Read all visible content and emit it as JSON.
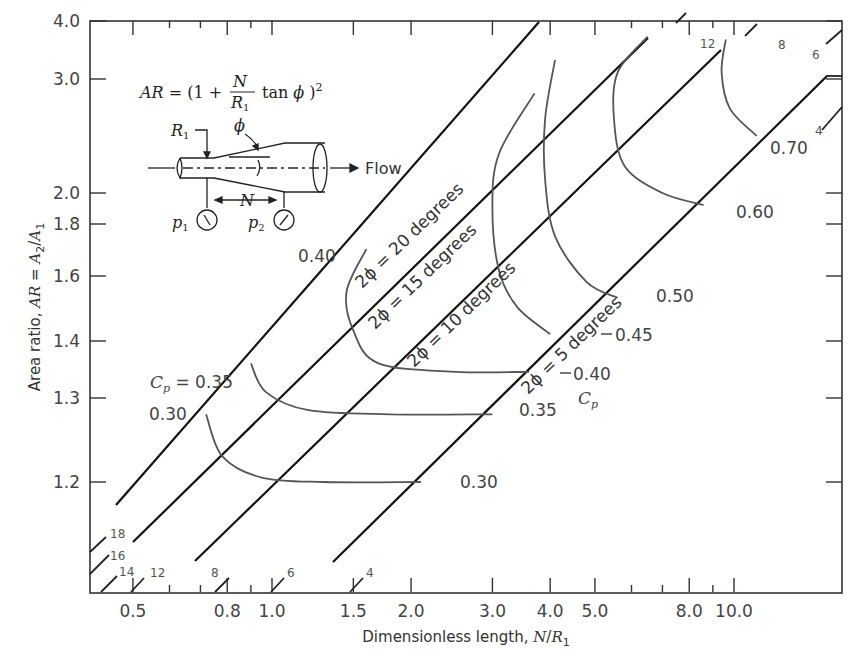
{
  "chart_data": {
    "type": "line",
    "title": "",
    "xlabel": "Dimensionless length, N/R1",
    "ylabel": "Area ratio, AR = A2/A1",
    "xscale": "log",
    "yscale": "log",
    "xlim": [
      0.4,
      18
    ],
    "ylim": [
      1.1,
      4.0
    ],
    "x_ticks": [
      0.5,
      0.8,
      1.0,
      1.5,
      2.0,
      3.0,
      4.0,
      5.0,
      8.0,
      10.0
    ],
    "x_tick_labels": [
      "0.5",
      "0.8",
      "1.0",
      "1.5",
      "2.0",
      "3.0",
      "4.0",
      "5.0",
      "8.0",
      "10.0"
    ],
    "y_ticks": [
      1.2,
      1.3,
      1.4,
      1.6,
      1.8,
      2.0,
      3.0,
      4.0
    ],
    "y_tick_labels": [
      "1.2",
      "1.3",
      "1.4",
      "1.6",
      "1.8",
      "2.0",
      "3.0",
      "4.0"
    ],
    "grid": false,
    "formula": "AR = (1 + N/R1 tan φ)^2",
    "diagram_labels": {
      "r1": "R1",
      "phi": "φ",
      "n": "N",
      "p1": "p1",
      "p2": "p2",
      "flow": "Flow"
    },
    "angle_lines": [
      {
        "name": "2φ = 20 degrees",
        "label": "2ϕ = 20 degrees"
      },
      {
        "name": "2φ = 15 degrees",
        "label": "2ϕ = 15 degrees"
      },
      {
        "name": "2φ = 10 degrees",
        "label": "2ϕ = 10 degrees"
      },
      {
        "name": "2φ = 5 degrees",
        "label": "2ϕ = 5 degrees"
      }
    ],
    "series": [
      {
        "name": "Cp = 0.30",
        "label": "0.30",
        "points": [
          [
            0.72,
            1.28
          ],
          [
            0.78,
            1.23
          ],
          [
            0.95,
            1.205
          ],
          [
            1.3,
            1.2
          ],
          [
            2.1,
            1.2
          ]
        ]
      },
      {
        "name": "Cp = 0.35",
        "label": "0.35",
        "points": [
          [
            0.9,
            1.36
          ],
          [
            0.97,
            1.31
          ],
          [
            1.2,
            1.285
          ],
          [
            1.8,
            1.28
          ],
          [
            3.0,
            1.28
          ]
        ]
      },
      {
        "name": "Cp = 0.40",
        "label": "0.40",
        "points": [
          [
            1.6,
            1.7
          ],
          [
            1.45,
            1.55
          ],
          [
            1.5,
            1.43
          ],
          [
            1.7,
            1.36
          ],
          [
            2.5,
            1.345
          ],
          [
            3.6,
            1.345
          ]
        ]
      },
      {
        "name": "Cp = 0.45",
        "label": "0.45",
        "points": [
          [
            3.7,
            2.85
          ],
          [
            3.1,
            2.3
          ],
          [
            3.0,
            1.9
          ],
          [
            3.1,
            1.62
          ],
          [
            3.4,
            1.5
          ],
          [
            4.0,
            1.42
          ]
        ]
      },
      {
        "name": "Cp = 0.50",
        "label": "0.50",
        "points": [
          [
            4.1,
            3.3
          ],
          [
            3.9,
            2.6
          ],
          [
            3.9,
            2.1
          ],
          [
            4.1,
            1.75
          ],
          [
            4.8,
            1.58
          ],
          [
            5.6,
            1.53
          ]
        ]
      },
      {
        "name": "Cp = 0.60",
        "label": "0.60",
        "points": [
          [
            6.5,
            3.7
          ],
          [
            5.6,
            3.1
          ],
          [
            5.5,
            2.6
          ],
          [
            5.8,
            2.2
          ],
          [
            7.0,
            2.0
          ],
          [
            8.6,
            1.92
          ]
        ]
      },
      {
        "name": "Cp = 0.70",
        "label": "0.70",
        "points": [
          [
            9.6,
            3.65
          ],
          [
            9.4,
            3.1
          ],
          [
            9.8,
            2.7
          ],
          [
            11.2,
            2.45
          ]
        ]
      }
    ],
    "cp_axis_label": "Cp",
    "cp_035_prefix": "Cp = 0.35",
    "edge_numbers_bottom": [
      "18",
      "16",
      "14",
      "12",
      "8",
      "6",
      "4"
    ],
    "edge_numbers_top": [
      "12",
      "8",
      "6",
      "4"
    ]
  }
}
